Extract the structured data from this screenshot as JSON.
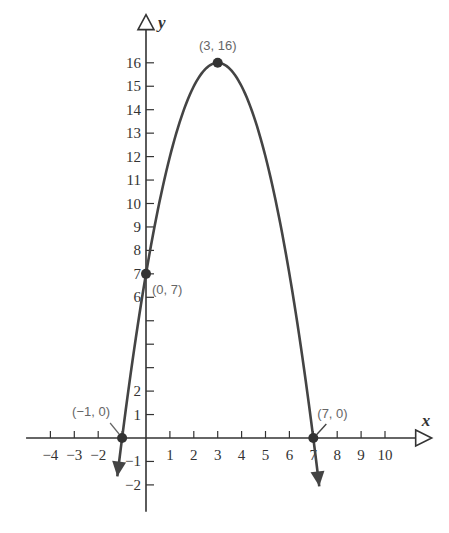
{
  "chart_data": {
    "type": "line",
    "title": "",
    "xlabel": "x",
    "ylabel": "y",
    "xlim": [
      -4.6,
      11.2
    ],
    "ylim": [
      -2.8,
      17.2
    ],
    "x_ticks": [
      -4,
      -3,
      -2,
      -1,
      1,
      2,
      3,
      4,
      5,
      6,
      7,
      8,
      9,
      10
    ],
    "x_tick_labels": [
      "-4",
      "-3",
      "-2",
      "",
      "1",
      "2",
      "3",
      "4",
      "5",
      "6",
      "7",
      "8",
      "9",
      "10"
    ],
    "y_ticks": [
      -2,
      -1,
      1,
      2,
      3,
      4,
      5,
      6,
      7,
      8,
      9,
      10,
      11,
      12,
      13,
      14,
      15,
      16
    ],
    "y_tick_labels": [
      "-2",
      "-1",
      "1",
      "2",
      "",
      "",
      "",
      "6",
      "7",
      "8",
      "9",
      "10",
      "11",
      "12",
      "13",
      "14",
      "15",
      "16"
    ],
    "grid": false,
    "series": [
      {
        "name": "y = -x^2 + 6x + 7",
        "equation": {
          "a": -1,
          "b": 6,
          "c": 7
        },
        "x_range": [
          -1.2,
          7.25
        ],
        "color": "#444444",
        "arrows": "both-ends"
      }
    ],
    "points": [
      {
        "x": 3,
        "y": 16,
        "label": "(3, 16)"
      },
      {
        "x": 0,
        "y": 7,
        "label": "(0, 7)"
      },
      {
        "x": -1,
        "y": 0,
        "label": "(−1, 0)"
      },
      {
        "x": 7,
        "y": 0,
        "label": "(7, 0)"
      }
    ]
  }
}
